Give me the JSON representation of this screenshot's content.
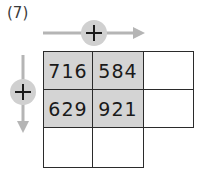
{
  "problem": {
    "label": "(7)"
  },
  "operators": {
    "horizontal": {
      "symbol": "+",
      "direction": "right",
      "icon": "plus-circle-icon"
    },
    "vertical": {
      "symbol": "+",
      "direction": "down",
      "icon": "plus-circle-icon"
    }
  },
  "colors": {
    "shaded_cell": "#d4d4d4",
    "arrow": "#b5b5b5",
    "circle": "#d0d0d0",
    "grid_line": "#2b2b2b"
  },
  "grid": {
    "rows": [
      [
        "716",
        "584",
        ""
      ],
      [
        "629",
        "921",
        ""
      ],
      [
        "",
        ""
      ]
    ]
  }
}
